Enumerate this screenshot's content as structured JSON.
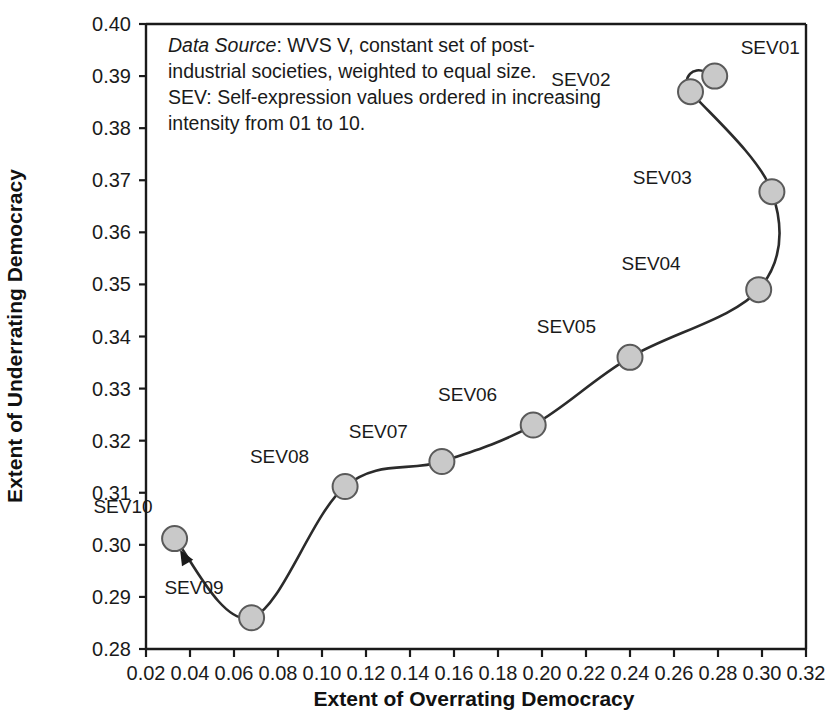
{
  "chart_data": {
    "type": "scatter",
    "title": "",
    "xlabel": "Extent of Overrating Democracy",
    "ylabel": "Extent of Underrating Democracy",
    "xlim": [
      0.02,
      0.32
    ],
    "ylim": [
      0.28,
      0.4
    ],
    "xticks": [
      "0.02",
      "0.04",
      "0.06",
      "0.08",
      "0.10",
      "0.12",
      "0.14",
      "0.16",
      "0.18",
      "0.20",
      "0.22",
      "0.24",
      "0.26",
      "0.28",
      "0.30",
      "0.32"
    ],
    "xtick_values": [
      0.02,
      0.04,
      0.06,
      0.08,
      0.1,
      0.12,
      0.14,
      0.16,
      0.18,
      0.2,
      0.22,
      0.24,
      0.26,
      0.28,
      0.3,
      0.32
    ],
    "yticks": [
      "0.28",
      "0.29",
      "0.30",
      "0.31",
      "0.32",
      "0.33",
      "0.34",
      "0.35",
      "0.36",
      "0.37",
      "0.38",
      "0.39",
      "0.40"
    ],
    "ytick_values": [
      0.28,
      0.29,
      0.3,
      0.31,
      0.32,
      0.33,
      0.34,
      0.35,
      0.36,
      0.37,
      0.38,
      0.39,
      0.4
    ],
    "grid": false,
    "legend": "none",
    "connected": true,
    "marker_fill": "#c9c9c9",
    "marker_edge": "#5a5a5a",
    "line_color": "#2b2b2b",
    "points": [
      {
        "label": "SEV01",
        "x": 0.2785,
        "y": 0.39,
        "label_dx": 26,
        "label_dy": -22
      },
      {
        "label": "SEV02",
        "x": 0.2675,
        "y": 0.387,
        "label_dx": -80,
        "label_dy": -6
      },
      {
        "label": "SEV03",
        "x": 0.3045,
        "y": 0.3678,
        "label_dx": -80,
        "label_dy": -8
      },
      {
        "label": "SEV04",
        "x": 0.2985,
        "y": 0.349,
        "label_dx": -78,
        "label_dy": -20
      },
      {
        "label": "SEV05",
        "x": 0.24,
        "y": 0.336,
        "label_dx": -34,
        "label_dy": -24
      },
      {
        "label": "SEV06",
        "x": 0.196,
        "y": 0.323,
        "label_dx": -36,
        "label_dy": -24
      },
      {
        "label": "SEV07",
        "x": 0.1545,
        "y": 0.316,
        "label_dx": -34,
        "label_dy": -24
      },
      {
        "label": "SEV08",
        "x": 0.1105,
        "y": 0.3112,
        "label_dx": -36,
        "label_dy": -24
      },
      {
        "label": "SEV09",
        "x": 0.068,
        "y": 0.286,
        "label_dx": -28,
        "label_dy": -24
      },
      {
        "label": "SEV10",
        "x": 0.033,
        "y": 0.3012,
        "label_dx": -22,
        "label_dy": -26
      }
    ],
    "annotation": {
      "lines": [
        {
          "emphasis": "Data Source",
          "rest": ": WVS V, constant set of post-"
        },
        {
          "emphasis": "",
          "rest": "industrial societies, weighted to equal size."
        },
        {
          "emphasis": "",
          "rest": "SEV: Self-expression values ordered in increasing"
        },
        {
          "emphasis": "",
          "rest": "intensity from 01 to 10."
        }
      ]
    },
    "arrow": {
      "from_x": 0.043,
      "from_y": 0.2935,
      "to_x": 0.0355,
      "to_y": 0.299
    }
  }
}
